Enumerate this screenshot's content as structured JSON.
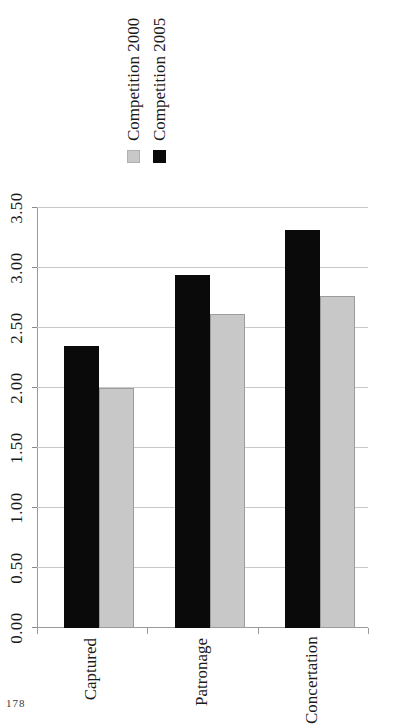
{
  "page": {
    "folio": "178"
  },
  "legend": {
    "position": "right",
    "items": [
      {
        "label": "Competition 2000",
        "color": "#c8c8c8",
        "swatch": "legend-swatch-gray"
      },
      {
        "label": "Competition 2005",
        "color": "#0a0a0a",
        "swatch": "legend-swatch-black"
      }
    ]
  },
  "axis": {
    "value_ticks": [
      "0.00",
      "0.50",
      "1.00",
      "1.50",
      "2.00",
      "2.50",
      "3.00",
      "3.50"
    ],
    "value_min": 0.0,
    "value_max": 3.5,
    "grid": true
  },
  "chart_data": {
    "type": "bar",
    "orientation": "horizontal",
    "title": "",
    "subtitle": "",
    "xlabel": "",
    "ylabel": "",
    "categories": [
      "Captured",
      "Patronage",
      "Concertation"
    ],
    "series": [
      {
        "name": "Competition 2000",
        "color": "#c8c8c8",
        "values": [
          2.0,
          2.62,
          2.77
        ]
      },
      {
        "name": "Competition 2005",
        "color": "#0a0a0a",
        "values": [
          2.35,
          2.94,
          3.32
        ]
      }
    ],
    "tick_labels": [
      "0.00",
      "0.50",
      "1.00",
      "1.50",
      "2.00",
      "2.50",
      "3.00",
      "3.50"
    ],
    "xlim": [
      0.0,
      3.5
    ],
    "legend_entries": [
      "Competition 2000",
      "Competition 2005"
    ],
    "legend_position": "right",
    "grid": true,
    "annotations": []
  }
}
